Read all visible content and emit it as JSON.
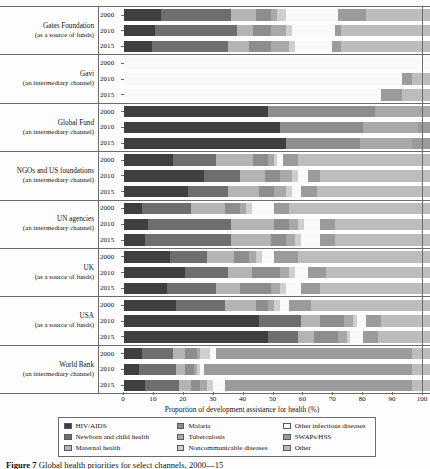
{
  "figure": {
    "caption_label": "Figure 7",
    "caption_text": "Global health priorities for select channels, 2000—15"
  },
  "axis": {
    "x_title": "Proportion of development assistance for health (%)",
    "x_ticks": [
      0,
      10,
      20,
      30,
      40,
      50,
      60,
      70,
      80,
      90,
      100
    ],
    "x_min": 0,
    "x_max": 100
  },
  "legend": {
    "columns": [
      [
        {
          "label": "HIV/AIDS",
          "color": "#3f3f3f"
        },
        {
          "label": "Newborn and child health",
          "color": "#6e6e6e"
        },
        {
          "label": "Maternal health",
          "color": "#b4b4b4"
        }
      ],
      [
        {
          "label": "Malaria",
          "color": "#8d8d8d"
        },
        {
          "label": "Tuberculosis",
          "color": "#a8a8a8"
        },
        {
          "label": "Noncommunicable diseases",
          "color": "#cfcfcf"
        }
      ],
      [
        {
          "label": "Other infectious diseases",
          "color": "#fafafa"
        },
        {
          "label": "SWAPs/HSS",
          "color": "#9b9b9b"
        },
        {
          "label": "Other",
          "color": "#bdbdbd"
        }
      ]
    ]
  },
  "chart_data": {
    "type": "bar",
    "orientation": "horizontal",
    "stacked": true,
    "normalized_percent": true,
    "title": "",
    "xlabel": "Proportion of development assistance for health (%)",
    "ylabel": "",
    "xlim": [
      0,
      100
    ],
    "grid": false,
    "legend_position": "bottom",
    "series": [
      {
        "name": "HIV/AIDS",
        "color": "#3f3f3f"
      },
      {
        "name": "Newborn and child health",
        "color": "#6e6e6e"
      },
      {
        "name": "Maternal health",
        "color": "#b4b4b4"
      },
      {
        "name": "Malaria",
        "color": "#8d8d8d"
      },
      {
        "name": "Tuberculosis",
        "color": "#a8a8a8"
      },
      {
        "name": "Noncommunicable diseases",
        "color": "#cfcfcf"
      },
      {
        "name": "Other infectious diseases",
        "color": "#fafafa"
      },
      {
        "name": "SWAPs/HSS",
        "color": "#9b9b9b"
      },
      {
        "name": "Other",
        "color": "#bdbdbd"
      }
    ],
    "groups": [
      {
        "name": "Gates Foundation",
        "subtitle": "(as a source of funds)",
        "rows": [
          {
            "year": "2000",
            "values": [
              12,
              23,
              8,
              5,
              2,
              3,
              17,
              9,
              21
            ]
          },
          {
            "year": "2010",
            "values": [
              10,
              27,
              5,
              6,
              5,
              2,
              14,
              2,
              29
            ]
          },
          {
            "year": "2015",
            "values": [
              9,
              25,
              7,
              7,
              6,
              2,
              12,
              3,
              29
            ]
          }
        ]
      },
      {
        "name": "Gavi",
        "subtitle": "(an intermediary channel)",
        "rows": [
          {
            "year": "2000",
            "values": [
              0,
              0,
              0,
              0,
              0,
              0,
              100,
              0,
              0
            ]
          },
          {
            "year": "2010",
            "values": [
              0,
              0,
              0,
              0,
              0,
              0,
              91,
              3,
              6
            ]
          },
          {
            "year": "2015",
            "values": [
              0,
              0,
              0,
              0,
              0,
              0,
              84,
              7,
              9
            ]
          }
        ]
      },
      {
        "name": "Global Fund",
        "subtitle": "(an intermediary channel)",
        "rows": [
          {
            "year": "2000",
            "values": [
              47,
              0,
              0,
              35,
              18,
              0,
              0,
              0,
              0
            ]
          },
          {
            "year": "2010",
            "values": [
              51,
              0,
              0,
              27,
              18,
              0,
              0,
              4,
              0
            ]
          },
          {
            "year": "2015",
            "values": [
              53,
              0,
              0,
              24,
              17,
              0,
              0,
              6,
              0
            ]
          }
        ]
      },
      {
        "name": "NGOs and US foundations",
        "subtitle": "(an intermediary channel)",
        "rows": [
          {
            "year": "2000",
            "values": [
              16,
              14,
              12,
              5,
              2,
              1,
              2,
              5,
              43
            ]
          },
          {
            "year": "2010",
            "values": [
              26,
              12,
              8,
              5,
              4,
              2,
              3,
              4,
              36
            ]
          },
          {
            "year": "2015",
            "values": [
              21,
              13,
              10,
              5,
              4,
              2,
              3,
              5,
              37
            ]
          }
        ]
      },
      {
        "name": "UN agencies",
        "subtitle": "(an intermediary channel)",
        "rows": [
          {
            "year": "2000",
            "values": [
              6,
              16,
              11,
              5,
              2,
              2,
              7,
              5,
              46
            ]
          },
          {
            "year": "2010",
            "values": [
              8,
              27,
              14,
              5,
              3,
              2,
              5,
              5,
              31
            ]
          },
          {
            "year": "2015",
            "values": [
              7,
              28,
              13,
              5,
              3,
              2,
              6,
              5,
              31
            ]
          }
        ]
      },
      {
        "name": "UK",
        "subtitle": "(as a source of funds)",
        "rows": [
          {
            "year": "2000",
            "values": [
              15,
              12,
              9,
              5,
              2,
              2,
              4,
              8,
              43
            ]
          },
          {
            "year": "2010",
            "values": [
              20,
              14,
              8,
              9,
              3,
              2,
              4,
              6,
              34
            ]
          },
          {
            "year": "2015",
            "values": [
              14,
              16,
              8,
              10,
              3,
              2,
              5,
              6,
              36
            ]
          }
        ]
      },
      {
        "name": "USA",
        "subtitle": "(as a source of funds)",
        "rows": [
          {
            "year": "2000",
            "values": [
              17,
              16,
              10,
              4,
              2,
              2,
              3,
              7,
              39
            ]
          },
          {
            "year": "2010",
            "values": [
              44,
              14,
              6,
              8,
              3,
              1,
              3,
              5,
              16
            ]
          },
          {
            "year": "2015",
            "values": [
              47,
              10,
              5,
              8,
              3,
              1,
              4,
              5,
              17
            ]
          }
        ]
      },
      {
        "name": "World Bank",
        "subtitle": "(an intermediary channel)",
        "rows": [
          {
            "year": "2000",
            "values": [
              6,
              10,
              4,
              4,
              1,
              3,
              2,
              64,
              6
            ]
          },
          {
            "year": "2010",
            "values": [
              5,
              12,
              3,
              3,
              1,
              1,
              1,
              68,
              6
            ]
          },
          {
            "year": "2015",
            "values": [
              7,
              11,
              4,
              3,
              2,
              2,
              4,
              61,
              6
            ]
          }
        ]
      }
    ]
  }
}
